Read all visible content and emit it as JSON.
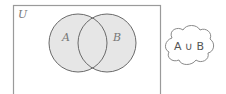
{
  "diagram": {
    "type": "venn",
    "universe_label": "U",
    "sets": [
      {
        "label": "A"
      },
      {
        "label": "B"
      }
    ],
    "shaded_region": "union",
    "colors": {
      "fill": "#e6e6e6",
      "stroke": "#6a6a6a",
      "border": "#9a9a9a"
    },
    "callout": {
      "text": "A ∪ B",
      "left": "A",
      "op": "∪",
      "right": "B"
    }
  }
}
